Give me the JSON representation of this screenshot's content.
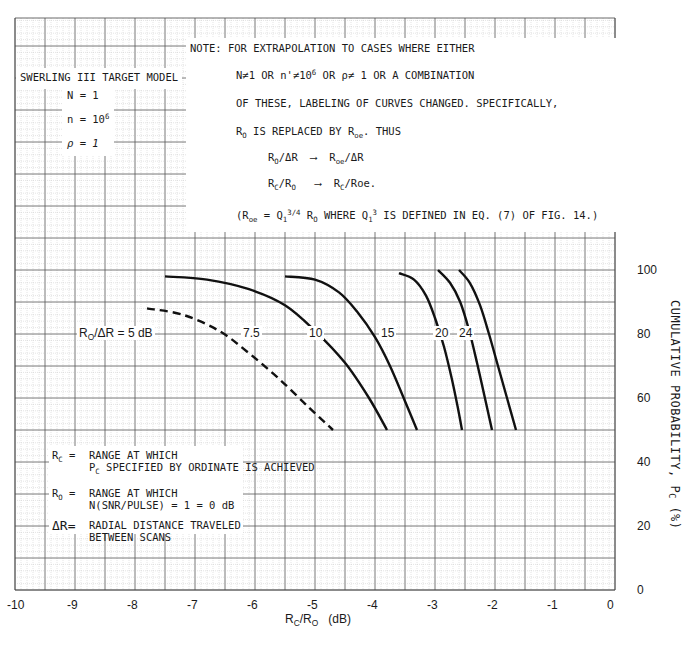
{
  "chart_data": {
    "type": "line",
    "title": "",
    "xlabel": "R_C/R_O (dB)",
    "ylabel": "CUMULATIVE PROBABILITY, P_C (%)",
    "xlim": [
      -10,
      0
    ],
    "ylim": [
      0,
      100
    ],
    "x_ticks": [
      "-10",
      "-9",
      "-8",
      "-7",
      "-6",
      "-5",
      "-4",
      "-3",
      "-2",
      "-1",
      "0"
    ],
    "y_ticks": [
      "0",
      "20",
      "40",
      "60",
      "80",
      "100"
    ],
    "grid": true,
    "series": [
      {
        "name": "R_O/ΔR = 5 dB",
        "label": "R_O/ΔR = 5 dB",
        "style": "dashed",
        "points": [
          [
            -7.8,
            88
          ],
          [
            -7.2,
            86
          ],
          [
            -6.6,
            81
          ],
          [
            -6.1,
            74
          ],
          [
            -5.6,
            66
          ],
          [
            -5.1,
            57
          ],
          [
            -4.7,
            50
          ]
        ]
      },
      {
        "name": "7.5",
        "label": "7.5",
        "style": "solid",
        "points": [
          [
            -7.5,
            98
          ],
          [
            -6.8,
            97
          ],
          [
            -6.1,
            94
          ],
          [
            -5.5,
            89
          ],
          [
            -5.0,
            81
          ],
          [
            -4.5,
            71
          ],
          [
            -4.1,
            60
          ],
          [
            -3.8,
            50
          ]
        ]
      },
      {
        "name": "10",
        "label": "10",
        "style": "solid",
        "points": [
          [
            -5.5,
            98
          ],
          [
            -5.0,
            97
          ],
          [
            -4.6,
            93
          ],
          [
            -4.3,
            87
          ],
          [
            -4.0,
            79
          ],
          [
            -3.75,
            70
          ],
          [
            -3.5,
            59
          ],
          [
            -3.3,
            50
          ]
        ]
      },
      {
        "name": "15",
        "label": "15",
        "style": "solid",
        "points": [
          [
            -3.6,
            99
          ],
          [
            -3.35,
            97
          ],
          [
            -3.15,
            92
          ],
          [
            -3.0,
            85
          ],
          [
            -2.85,
            76
          ],
          [
            -2.72,
            66
          ],
          [
            -2.62,
            57
          ],
          [
            -2.55,
            50
          ]
        ]
      },
      {
        "name": "20",
        "label": "20",
        "style": "solid",
        "points": [
          [
            -2.95,
            100
          ],
          [
            -2.75,
            96
          ],
          [
            -2.58,
            90
          ],
          [
            -2.43,
            81
          ],
          [
            -2.3,
            71
          ],
          [
            -2.18,
            61
          ],
          [
            -2.05,
            50
          ]
        ]
      },
      {
        "name": "24",
        "label": "24",
        "style": "solid",
        "points": [
          [
            -2.6,
            100
          ],
          [
            -2.42,
            96
          ],
          [
            -2.25,
            89
          ],
          [
            -2.1,
            80
          ],
          [
            -1.95,
            70
          ],
          [
            -1.8,
            60
          ],
          [
            -1.65,
            50
          ]
        ]
      }
    ]
  },
  "model_box": {
    "title": "SWERLING III TARGET MODEL",
    "n_big": "N = 1",
    "n_small_prefix": "n = 10",
    "n_small_exp": "6",
    "rho": "ρ = 1"
  },
  "note": {
    "line1": "NOTE:  FOR EXTRAPOLATION TO CASES WHERE EITHER",
    "line2a": "N≠1  OR n'≠10",
    "line2exp": "6",
    "line2b": " OR ρ≠ 1 OR A COMBINATION",
    "line3": "OF THESE, LABELING OF CURVES CHANGED.  SPECIFICALLY,",
    "line4a": "R",
    "line4sub": "O",
    "line4b": " IS REPLACED BY R",
    "line4sub2": "oe",
    "line4c": ".  THUS",
    "map1_from": "R_O/ΔR",
    "map1_to": "Roe/ΔR",
    "map2_from": "R_C/R_O",
    "map2_to": "R_C/Roe.",
    "arrow": "⟶",
    "line7": "(Roe = Q₁^3/4 R_O WHERE Q₁^3 IS DEFINED IN EQ. (7) OF FIG. 14.)"
  },
  "legend_box": {
    "rc_key": "R",
    "rc_sub": "C",
    "rc_eq": " =",
    "rc_text1": "RANGE AT WHICH",
    "rc_text2_p": "P",
    "rc_text2_sub": "C",
    "rc_text2": " SPECIFIED BY ORDINATE IS ACHIEVED",
    "ro_key": "R",
    "ro_sub": "O",
    "ro_eq": " =",
    "ro_text1": "RANGE AT WHICH",
    "ro_text2": "N(SNR/PULSE) = 1 = 0 dB",
    "dr_key": "ΔR=",
    "dr_text1": "RADIAL DISTANCE TRAVELED",
    "dr_text2": "BETWEEN SCANS"
  },
  "axis": {
    "x_title": "R_C/R_O  (dB)",
    "y_title": "CUMULATIVE PROBABILITY, P_C (%)"
  }
}
